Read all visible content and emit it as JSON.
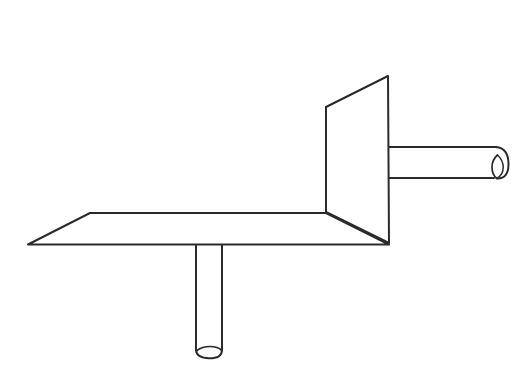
{
  "canvas": {
    "width": 529,
    "height": 384,
    "background_color": "#ffffff",
    "title": "Technical line drawing of mechanical bracket assembly"
  },
  "style": {
    "stroke_color": "#2b2b2b",
    "fill_color": "#ffffff",
    "stroke_width_main": 2.0,
    "stroke_width_thin": 1.4
  },
  "chart_data": {
    "type": "line",
    "xlabel": "",
    "ylabel": "",
    "parts": [
      {
        "name": "horizontal-plate",
        "description": "Flat horizontal parallelogram plate seen in perspective",
        "points": [
          [
            28,
            244
          ],
          [
            90,
            213
          ],
          [
            326,
            213
          ],
          [
            389,
            244
          ]
        ],
        "closed": true
      },
      {
        "name": "vertical-panel",
        "description": "Upright trapezoidal panel rising from right end of plate",
        "points": [
          [
            326,
            107
          ],
          [
            388,
            76
          ],
          [
            389,
            243
          ],
          [
            326,
            212
          ]
        ],
        "closed": true
      },
      {
        "name": "panel-inner-edge",
        "description": "Vertical fold line at left of upright panel",
        "points": [
          [
            326,
            107
          ],
          [
            326,
            212
          ]
        ],
        "closed": false
      },
      {
        "name": "horizontal-rod",
        "description": "Cylindrical rod projecting right from the upright panel",
        "points": [
          [
            388,
            147
          ],
          [
            497,
            147
          ],
          [
            497,
            178
          ],
          [
            388,
            178
          ]
        ],
        "closed": false,
        "cap": {
          "center_x": 497,
          "top_y": 147,
          "bottom_y": 178,
          "bulge_x": 508,
          "end_ellipse_cx": 497,
          "end_ellipse_cy": 166,
          "end_ellipse_rx": 5,
          "end_ellipse_ry": 11
        }
      },
      {
        "name": "vertical-post",
        "description": "Cylindrical post hanging down from the underside of the plate",
        "points": [
          [
            196,
            245
          ],
          [
            196,
            352
          ],
          [
            222,
            352
          ],
          [
            222,
            245
          ]
        ],
        "closed": false,
        "cap": {
          "left_x": 196,
          "right_x": 222,
          "bottom_y": 357,
          "end_ellipse_cx": 210,
          "end_ellipse_cy": 351,
          "end_ellipse_rx": 11,
          "end_ellipse_ry": 4
        }
      }
    ],
    "grid": false,
    "legend": null
  }
}
